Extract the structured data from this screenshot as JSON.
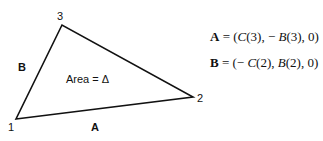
{
  "diagram": {
    "type": "triangle",
    "vertices": [
      {
        "label": "1",
        "x": 16,
        "y": 119
      },
      {
        "label": "2",
        "x": 193,
        "y": 97
      },
      {
        "label": "3",
        "x": 62,
        "y": 25
      }
    ],
    "edges": [
      {
        "label": "A",
        "from": "1",
        "to": "2"
      },
      {
        "label": "B",
        "from": "1",
        "to": "3"
      }
    ],
    "area_label": "Area = Δ",
    "stroke_color": "#111111"
  },
  "equations": {
    "eq1": {
      "lhs": "A",
      "eq": " = (",
      "c": "C",
      "rest1": "(3), − ",
      "b": "B",
      "rest2": "(3), 0)"
    },
    "eq2": {
      "lhs": "B",
      "eq": " = (− ",
      "c": "C",
      "rest1": "(2), ",
      "b": "B",
      "rest2": "(2), 0)"
    }
  }
}
